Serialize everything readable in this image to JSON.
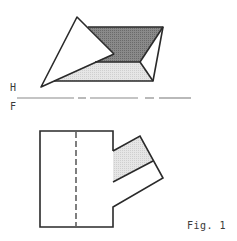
{
  "figure": {
    "caption": "Fig. 1",
    "plane_labels": {
      "horizontal": "H",
      "frontal": "F"
    }
  },
  "colors": {
    "line": "#2a2a2a",
    "dark_fill": "#7a7a7a",
    "light_fill": "#dcdcdc",
    "fold_line": "#8a8a8a",
    "background": "#ffffff"
  },
  "views": {
    "top_view": {
      "description": "Horizontal projection: triangle overlapping a shaded parallelogram"
    },
    "front_view": {
      "description": "Frontal projection: rectangle with hidden centerline and angled branch"
    }
  }
}
